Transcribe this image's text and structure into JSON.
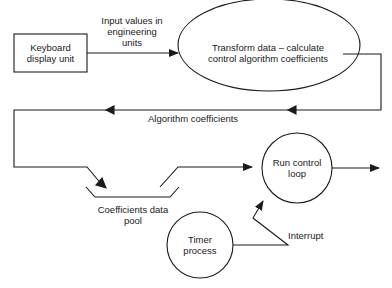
{
  "diagram": {
    "nodes": {
      "keyboard": {
        "label_line1": "Keyboard",
        "label_line2": "display unit",
        "shape": "rectangle"
      },
      "transform": {
        "label_line1": "Transform data – calculate",
        "label_line2": "control algorithm coefficients",
        "shape": "ellipse"
      },
      "pool": {
        "label_line1": "Coefficients data",
        "label_line2": "pool",
        "shape": "data-store"
      },
      "run": {
        "label_line1": "Run control",
        "label_line2": "loop",
        "shape": "circle"
      },
      "timer": {
        "label_line1": "Timer",
        "label_line2": "process",
        "shape": "circle"
      }
    },
    "edges": {
      "input": {
        "label_line1": "Input values in",
        "label_line2": "engineering",
        "label_line3": "units"
      },
      "coefficients": {
        "label": "Algorithm coefficients"
      },
      "interrupt": {
        "label": "Interrupt"
      }
    },
    "colors": {
      "stroke": "#1a1a1a",
      "background": "#ffffff"
    }
  }
}
